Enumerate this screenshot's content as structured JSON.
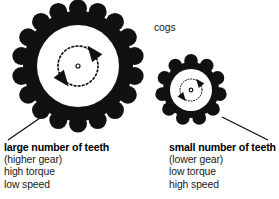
{
  "figure": {
    "background_color": "#ffffff",
    "ink_color": "#111111"
  },
  "annotations": {
    "cogs_label": "cogs"
  },
  "gears": [
    {
      "id": "large-gear",
      "teeth_count": 18,
      "center_x": 78,
      "center_y": 66,
      "outer_radius": 64,
      "root_radius": 55,
      "hole_radius": 41,
      "tooth_radius": 9,
      "rotation_circle_radius": 20,
      "hub_dot_radius": 2,
      "rotation_direction": "counterclockwise",
      "color": "#111111",
      "caption": {
        "heading": "large number of teeth",
        "lines": [
          "(higher gear)",
          "high torque",
          "low speed"
        ]
      },
      "leader": {
        "x1": 8,
        "y1": 140,
        "x2": 40,
        "y2": 118
      }
    },
    {
      "id": "small-gear",
      "teeth_count": 11,
      "center_x": 191,
      "center_y": 90,
      "outer_radius": 34,
      "root_radius": 28,
      "hole_radius": 21,
      "tooth_radius": 6.8,
      "rotation_circle_radius": 11,
      "hub_dot_radius": 1.8,
      "rotation_direction": "counterclockwise",
      "color": "#111111",
      "caption": {
        "heading": "small number of teeth",
        "lines": [
          "(lower gear)",
          "low torque",
          "high speed"
        ]
      },
      "leader": {
        "x1": 268,
        "y1": 140,
        "x2": 222,
        "y2": 117
      }
    }
  ]
}
